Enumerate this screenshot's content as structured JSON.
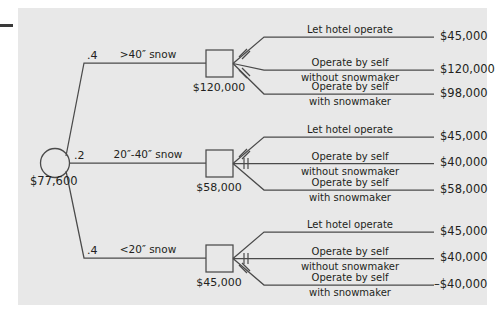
{
  "diagram": {
    "type": "decision-tree",
    "background_color": "#e8e8e8",
    "line_color": "#4a4a4a",
    "text_color": "#231f20",
    "root": {
      "node_type": "chance-circle",
      "value": "$77,600"
    },
    "branches": [
      {
        "probability": ".4",
        "condition": ">40″ snow",
        "node_type": "decision-square",
        "node_value": "$120,000",
        "options": [
          {
            "label_line1": "Let hotel operate",
            "label_line2": "",
            "payoff": "$45,000",
            "pruned": true
          },
          {
            "label_line1": "Operate by self",
            "label_line2": "without snowmaker",
            "payoff": "$120,000",
            "pruned": false
          },
          {
            "label_line1": "Operate by self",
            "label_line2": "with snowmaker",
            "payoff": "$98,000",
            "pruned": true
          }
        ]
      },
      {
        "probability": ".2",
        "condition": "20″-40″ snow",
        "node_type": "decision-square",
        "node_value": "$58,000",
        "options": [
          {
            "label_line1": "Let hotel operate",
            "label_line2": "",
            "payoff": "$45,000",
            "pruned": true
          },
          {
            "label_line1": "Operate by self",
            "label_line2": "without snowmaker",
            "payoff": "$40,000",
            "pruned": true
          },
          {
            "label_line1": "Operate by self",
            "label_line2": "with snowmaker",
            "payoff": "$58,000",
            "pruned": false
          }
        ]
      },
      {
        "probability": ".4",
        "condition": "<20″ snow",
        "node_type": "decision-square",
        "node_value": "$45,000",
        "options": [
          {
            "label_line1": "Let hotel operate",
            "label_line2": "",
            "payoff": "$45,000",
            "pruned": false
          },
          {
            "label_line1": "Operate by self",
            "label_line2": "without snowmaker",
            "payoff": "$40,000",
            "pruned": true
          },
          {
            "label_line1": "Operate by self",
            "label_line2": "with snowmaker",
            "payoff": "–$40,000",
            "pruned": true
          }
        ]
      }
    ]
  }
}
